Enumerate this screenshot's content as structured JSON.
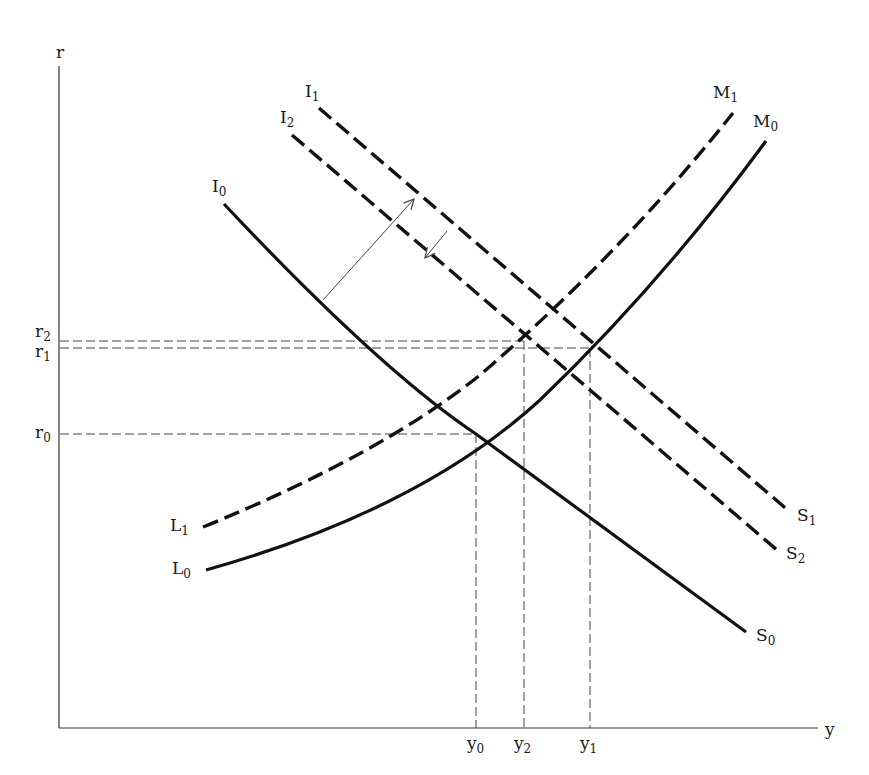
{
  "axes": {
    "y_axis_label": "r",
    "x_axis_label": "y"
  },
  "curves": {
    "I0": {
      "name": "I",
      "sub": "0",
      "end_name": "S",
      "end_sub": "0",
      "style": "solid"
    },
    "I1": {
      "name": "I",
      "sub": "1",
      "end_name": "S",
      "end_sub": "1",
      "style": "dashed"
    },
    "I2": {
      "name": "I",
      "sub": "2",
      "end_name": "S",
      "end_sub": "2",
      "style": "dashed"
    },
    "L0": {
      "name": "L",
      "sub": "0",
      "end_name": "M",
      "end_sub": "0",
      "style": "solid"
    },
    "L1": {
      "name": "L",
      "sub": "1",
      "end_name": "M",
      "end_sub": "1",
      "style": "dashed"
    }
  },
  "r_ticks": [
    {
      "name": "r",
      "sub": "2"
    },
    {
      "name": "r",
      "sub": "1"
    },
    {
      "name": "r",
      "sub": "0"
    }
  ],
  "y_ticks": [
    {
      "name": "y",
      "sub": "0"
    },
    {
      "name": "y",
      "sub": "2"
    },
    {
      "name": "y",
      "sub": "1"
    }
  ],
  "equilibria": [
    {
      "label": "E0",
      "y": "y0",
      "r": "r0",
      "curves": [
        "I0-S0",
        "L0-M0"
      ]
    },
    {
      "label": "E1",
      "y": "y1",
      "r": "r1",
      "curves": [
        "I1-S1",
        "L0-M0"
      ]
    },
    {
      "label": "E2",
      "y": "y2",
      "r": "r2",
      "curves": [
        "I2-S2",
        "L1-M1"
      ]
    }
  ],
  "shifts": [
    {
      "from": "I0-S0",
      "to": "I1-S1",
      "direction": "outward"
    },
    {
      "from": "I1-S1",
      "to": "I2-S2",
      "direction": "inward"
    }
  ]
}
